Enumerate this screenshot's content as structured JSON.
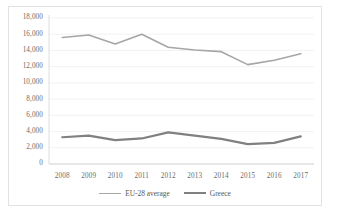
{
  "chart_data": {
    "type": "line",
    "title": "",
    "xlabel": "",
    "ylabel": "",
    "categories": [
      "2008",
      "2009",
      "2010",
      "2011",
      "2012",
      "2013",
      "2014",
      "2015",
      "2016",
      "2017"
    ],
    "ylim": [
      0,
      18000
    ],
    "ytick_labels": [
      "18,000",
      "16,000",
      "14,000",
      "12,000",
      "10,000",
      "8,000",
      "6,000",
      "4,000",
      "2,000",
      "0"
    ],
    "ytick_values": [
      18000,
      16000,
      14000,
      12000,
      10000,
      8000,
      6000,
      4000,
      2000,
      0
    ],
    "grid": true,
    "legend_position": "bottom",
    "series": [
      {
        "name": "EU-28 average",
        "color": "#a6a6a6",
        "width": 1.6,
        "values": [
          15600,
          15900,
          14800,
          16000,
          14400,
          14050,
          13850,
          12250,
          12800,
          13600
        ]
      },
      {
        "name": "Greece",
        "color": "#808080",
        "width": 2.2,
        "values": [
          3300,
          3500,
          2950,
          3150,
          3900,
          3500,
          3100,
          2450,
          2600,
          3400
        ]
      }
    ]
  },
  "legend": {
    "items": [
      {
        "label": "EU-28 average"
      },
      {
        "label": "Greece"
      }
    ]
  }
}
